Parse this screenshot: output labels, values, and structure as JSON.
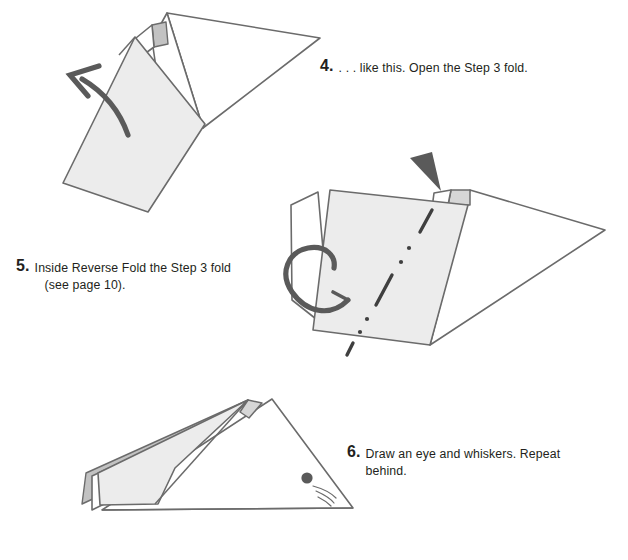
{
  "page": {
    "background_color": "#ffffff",
    "paper_fill_light": "#ececec",
    "paper_fill_mid": "#d9d9d9",
    "paper_fill_dark": "#c2c2c2",
    "outline_color": "#6b6b6b",
    "ink_color": "#231f20",
    "arrow_color": "#5a5a5a"
  },
  "steps": [
    {
      "number": "4.",
      "text_lines": [
        ". . . like this. Open the Step 3 fold."
      ],
      "figure": "step4-diagram"
    },
    {
      "number": "5.",
      "text_lines": [
        "Inside Reverse Fold the Step 3 fold",
        "(see page 10)."
      ],
      "figure": "step5-diagram"
    },
    {
      "number": "6.",
      "text_lines": [
        "Draw an eye and whiskers. Repeat",
        "behind."
      ],
      "figure": "step6-diagram"
    }
  ],
  "diagram_annotations": {
    "step4": {
      "arrow": "curved-arrow-up-left",
      "arrow_meaning": "open the fold upward and to the left"
    },
    "step5": {
      "fold_line": "dash-dot-dot-line",
      "fold_line_meaning": "inside reverse fold crease",
      "push_arrow": "solid-wedge-arrowhead-down",
      "wrap_arrow": "looping-arrow-around-left-edge"
    },
    "step6": {
      "eye": "filled-circle",
      "whiskers": "three-thin-arcs"
    }
  }
}
